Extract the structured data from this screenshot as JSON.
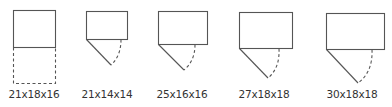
{
  "diagram": {
    "stroke_color": "#555555",
    "items": [
      {
        "label": "21x18x16",
        "type": "rect-with-dashed-extension",
        "rect": {
          "x": 13,
          "y": 10,
          "w": 42,
          "h": 37
        },
        "dashed_extension_bottom": 83
      },
      {
        "label": "21x14x14",
        "type": "rect-with-swing",
        "rect": {
          "x": 86,
          "y": 11,
          "w": 41,
          "h": 28
        },
        "tip": {
          "x": 111,
          "y": 65
        },
        "dash_start": {
          "x": 121,
          "y": 39
        }
      },
      {
        "label": "25x16x16",
        "type": "rect-with-swing",
        "rect": {
          "x": 158,
          "y": 11,
          "w": 49,
          "h": 33
        },
        "tip": {
          "x": 184,
          "y": 70
        },
        "dash_start": {
          "x": 195,
          "y": 44
        }
      },
      {
        "label": "27x18x18",
        "type": "rect-with-swing",
        "rect": {
          "x": 239,
          "y": 12,
          "w": 53,
          "h": 36
        },
        "tip": {
          "x": 268,
          "y": 78
        },
        "dash_start": {
          "x": 279,
          "y": 48
        }
      },
      {
        "label": "30x18x18",
        "type": "rect-with-swing",
        "rect": {
          "x": 326,
          "y": 13,
          "w": 58,
          "h": 36
        },
        "tip": {
          "x": 358,
          "y": 83
        },
        "dash_start": {
          "x": 372,
          "y": 49
        }
      }
    ]
  }
}
